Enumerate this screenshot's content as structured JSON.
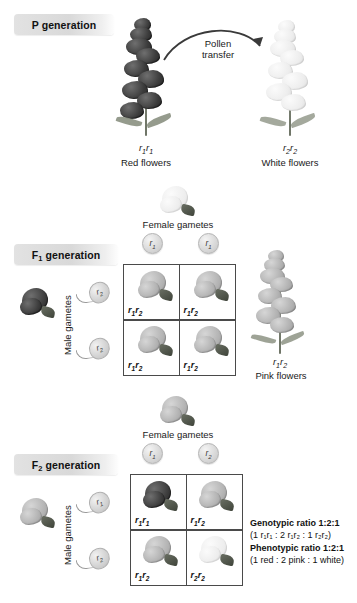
{
  "figure": {
    "background": "#ffffff"
  },
  "p_generation": {
    "label_main": "P",
    "label_sub": "",
    "label_rest": " generation",
    "pollen_arrow_label_line1": "Pollen",
    "pollen_arrow_label_line2": "transfer",
    "parents": [
      {
        "genotype_prefix": "r",
        "genotype": "r₁r₁",
        "allele1": "r",
        "sub1": "1",
        "allele2": "r",
        "sub2": "1",
        "phenotype": "Red flowers",
        "color": "#3b3b3b",
        "color_name": "red"
      },
      {
        "genotype": "r₂r₂",
        "allele1": "r",
        "sub1": "2",
        "allele2": "r",
        "sub2": "2",
        "phenotype": "White flowers",
        "color": "#ededed",
        "color_name": "white"
      }
    ]
  },
  "f1_generation": {
    "label_main": "F",
    "label_sub": "1",
    "label_rest": " generation",
    "female_gametes_label": "Female gametes",
    "male_gametes_label": "Male gametes",
    "female_gametes": [
      {
        "allele": "r",
        "sub": "1"
      },
      {
        "allele": "r",
        "sub": "1"
      }
    ],
    "male_gametes": [
      {
        "allele": "r",
        "sub": "2"
      },
      {
        "allele": "r",
        "sub": "2"
      }
    ],
    "female_parent_color_name": "white",
    "male_parent_color_name": "red",
    "punnett_cells": [
      {
        "allele1": "r",
        "sub1": "1",
        "allele2": "r",
        "sub2": "2",
        "genotype": "r₁r₂",
        "color_name": "pink"
      },
      {
        "allele1": "r",
        "sub1": "1",
        "allele2": "r",
        "sub2": "2",
        "genotype": "r₁r₂",
        "color_name": "pink"
      },
      {
        "allele1": "r",
        "sub1": "1",
        "allele2": "r",
        "sub2": "2",
        "genotype": "r₁r₂",
        "color_name": "pink"
      },
      {
        "allele1": "r",
        "sub1": "1",
        "allele2": "r",
        "sub2": "2",
        "genotype": "r₁r₂",
        "color_name": "pink"
      }
    ],
    "offspring_plant": {
      "allele1": "r",
      "sub1": "1",
      "allele2": "r",
      "sub2": "2",
      "genotype": "r₁r₂",
      "phenotype": "Pink flowers",
      "color_name": "pink"
    }
  },
  "f2_generation": {
    "label_main": "F",
    "label_sub": "2",
    "label_rest": " generation",
    "female_gametes_label": "Female gametes",
    "male_gametes_label": "Male gametes",
    "female_gametes": [
      {
        "allele": "r",
        "sub": "1"
      },
      {
        "allele": "r",
        "sub": "2"
      }
    ],
    "male_gametes": [
      {
        "allele": "r",
        "sub": "1"
      },
      {
        "allele": "r",
        "sub": "2"
      }
    ],
    "female_parent_color_name": "pink",
    "male_parent_color_name": "pink",
    "punnett_cells": [
      {
        "allele1": "r",
        "sub1": "1",
        "allele2": "r",
        "sub2": "1",
        "genotype": "r₁r₁",
        "color_name": "red"
      },
      {
        "allele1": "r",
        "sub1": "1",
        "allele2": "r",
        "sub2": "2",
        "genotype": "r₁r₂",
        "color_name": "pink"
      },
      {
        "allele1": "r",
        "sub1": "1",
        "allele2": "r",
        "sub2": "2",
        "genotype": "r₁r₂",
        "color_name": "pink"
      },
      {
        "allele1": "r",
        "sub1": "2",
        "allele2": "r",
        "sub2": "2",
        "genotype": "r₂r₂",
        "color_name": "white"
      }
    ],
    "results": {
      "genotypic_heading": "Genotypic ratio 1:2:1",
      "genotypic_detail_open": "(1 ",
      "genotypic_detail": "(1 r₁r₁ : 2 r₁r₂ : 1 r₂r₂)",
      "phenotypic_heading": "Phenotypic ratio 1:2:1",
      "phenotypic_detail": "(1 red : 2 pink : 1 white)"
    }
  }
}
